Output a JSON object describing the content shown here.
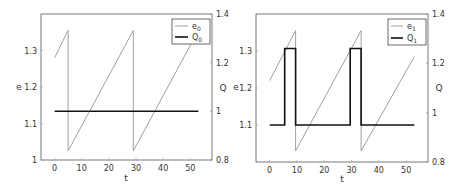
{
  "chart_data": [
    {
      "type": "line",
      "title": "",
      "xlabel": "t",
      "ylabel": "e",
      "ylabel_right": "Q",
      "xlim": [
        -5,
        58
      ],
      "ylim": [
        1.0,
        1.4
      ],
      "ylim_right": [
        0.8,
        1.4
      ],
      "xticks": [
        "0",
        "10",
        "20",
        "30",
        "40",
        "50"
      ],
      "yticks": [
        "1",
        "1.1",
        "1.2",
        "1.3"
      ],
      "yticks_right": [
        "0.8",
        "1",
        "1.2",
        "1.4"
      ],
      "grid": false,
      "legend_position": "upper right",
      "legend": [
        "e0",
        "Q0"
      ],
      "series": [
        {
          "name": "e0",
          "axis": "left",
          "color": "#a0a0a0",
          "x": [
            0,
            5,
            5,
            29,
            29,
            53
          ],
          "y": [
            1.28,
            1.355,
            1.025,
            1.355,
            1.025,
            1.355
          ]
        },
        {
          "name": "Q0",
          "axis": "right",
          "color": "#111111",
          "x": [
            0,
            53
          ],
          "y": [
            1.0,
            1.0
          ]
        }
      ]
    },
    {
      "type": "line",
      "title": "",
      "xlabel": "t",
      "ylabel": "e",
      "ylabel_right": "Q",
      "xlim": [
        -5,
        58
      ],
      "ylim": [
        1.0,
        1.4
      ],
      "ylim_right": [
        0.8,
        1.4
      ],
      "xticks": [
        "0",
        "10",
        "20",
        "30",
        "40",
        "50"
      ],
      "yticks": [
        "1.1",
        "1.2",
        "1.3"
      ],
      "yticks_right": [
        "0.8",
        "1",
        "1.2",
        "1.4"
      ],
      "grid": false,
      "legend_position": "upper right",
      "legend": [
        "e1",
        "Q1"
      ],
      "series": [
        {
          "name": "e1",
          "axis": "left",
          "color": "#a0a0a0",
          "x": [
            0,
            9.5,
            9.5,
            33.5,
            33.5,
            53
          ],
          "y": [
            1.22,
            1.355,
            1.03,
            1.355,
            1.03,
            1.285
          ]
        },
        {
          "name": "Q1",
          "axis": "right",
          "color": "#111111",
          "x": [
            0,
            5.5,
            5.5,
            9.5,
            9.5,
            29.5,
            29.5,
            33.5,
            33.5,
            53
          ],
          "y": [
            0.95,
            0.95,
            1.26,
            1.26,
            0.95,
            0.95,
            1.26,
            1.26,
            0.95,
            0.95
          ]
        }
      ]
    }
  ],
  "panels": [
    {
      "xlabel": "t",
      "ylabel": "e",
      "ylabel_right": "Q",
      "legend_e": "e",
      "legend_e_sub": "0",
      "legend_q": "Q",
      "legend_q_sub": "0"
    },
    {
      "xlabel": "t",
      "ylabel": "e",
      "ylabel_right": "Q",
      "legend_e": "e",
      "legend_e_sub": "1",
      "legend_q": "Q",
      "legend_q_sub": "1"
    }
  ]
}
